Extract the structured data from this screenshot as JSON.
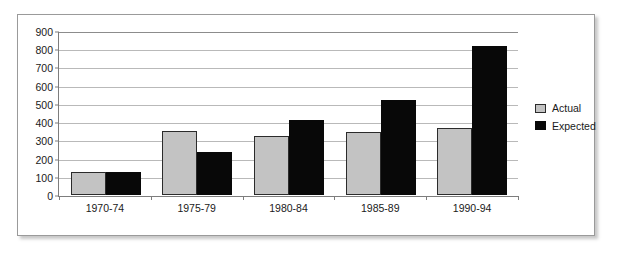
{
  "chart_data": {
    "type": "bar",
    "title": "",
    "subtitle": "",
    "xlabel": "",
    "ylabel": "",
    "categories": [
      "1970-74",
      "1975-79",
      "1980-84",
      "1985-89",
      "1990-94"
    ],
    "series": [
      {
        "name": "Actual",
        "color": "#c3c3c3",
        "values": [
          125,
          355,
          328,
          347,
          371
        ]
      },
      {
        "name": "Expected",
        "color": "#080808",
        "values": [
          126,
          240,
          416,
          525,
          821
        ]
      }
    ],
    "ylim": [
      0,
      900
    ],
    "ytick_step": 100,
    "ytick_labels": [
      "900",
      "800",
      "700",
      "600",
      "500",
      "400",
      "300",
      "200",
      "100",
      "0"
    ],
    "ytick_values": [
      900,
      800,
      700,
      600,
      500,
      400,
      300,
      200,
      100,
      0
    ],
    "grid": true,
    "grid_axis": "y",
    "legend_position": "right",
    "legend_entries": [
      "Actual",
      "Expected"
    ],
    "annotations": [],
    "plot_background": "#ffffff",
    "grid_color": "#b9b9b9",
    "axis_color": "#7d7d7d",
    "frame_border_color": "#9a9a9a"
  }
}
